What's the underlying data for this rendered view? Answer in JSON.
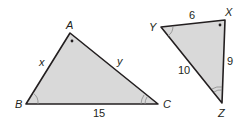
{
  "diagram": {
    "fill_color": "#d9d9d9",
    "stroke_color": "#231f20",
    "triangle_abc": {
      "vertices": {
        "A": "A",
        "B": "B",
        "C": "C"
      },
      "sides": {
        "AB": "x",
        "AC": "y",
        "BC": "15"
      },
      "angle_marks": {
        "A": "dot",
        "B": "single-arc",
        "C": "double-arc"
      }
    },
    "triangle_xyz": {
      "vertices": {
        "X": "X",
        "Y": "Y",
        "Z": "Z"
      },
      "sides": {
        "YX": "6",
        "XZ": "9",
        "YZ": "10"
      },
      "angle_marks": {
        "X": "dot",
        "Y": "single-arc",
        "Z": "double-arc"
      }
    }
  }
}
